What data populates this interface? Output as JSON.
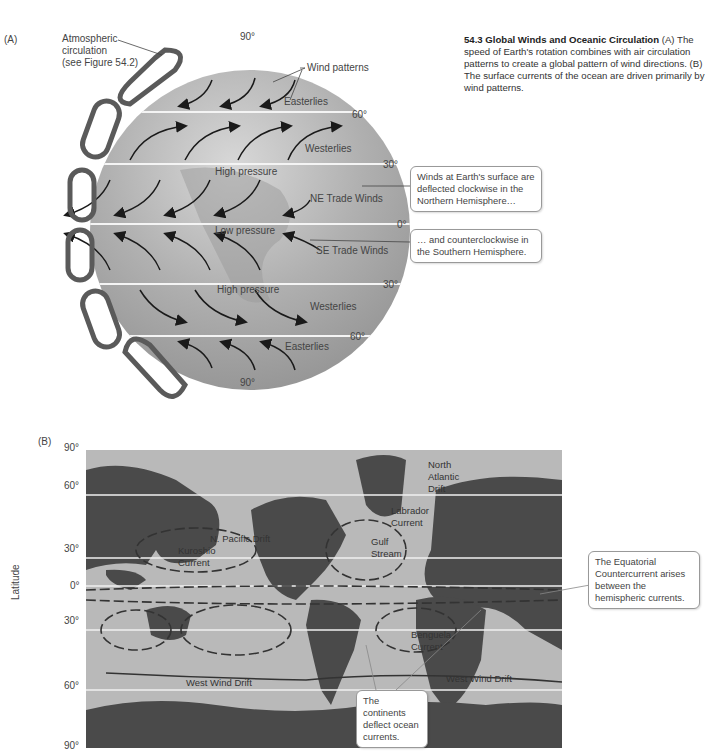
{
  "caption": {
    "number": "54.3",
    "title": "Global Winds and Oceanic Circulation",
    "text": "(A) The speed of Earth's rotation combines with air circulation patterns to create a global pattern of wind directions. (B) The surface currents of the ocean are driven primarily by wind patterns."
  },
  "panel_a": {
    "label": "(A)",
    "atmospheric_label_1": "Atmospheric",
    "atmospheric_label_2": "circulation",
    "atmospheric_label_3": "(see Figure 54.2)",
    "wind_patterns": "Wind patterns",
    "lat_90_top": "90°",
    "lat_60_n": "60°",
    "lat_30_n": "30°",
    "lat_0": "0°",
    "lat_30_s": "30°",
    "lat_60_s": "60°",
    "lat_90_bottom": "90°",
    "zones": {
      "easterlies_n": "Easterlies",
      "westerlies_n": "Westerlies",
      "high_pressure_n": "High pressure",
      "ne_trade": "NE Trade Winds",
      "low_pressure": "Low pressure",
      "se_trade": "SE Trade Winds",
      "high_pressure_s": "High pressure",
      "westerlies_s": "Westerlies",
      "easterlies_s": "Easterlies"
    },
    "callout_north": "Winds at Earth's surface are deflected clockwise in the Northern Hemisphere…",
    "callout_south": "… and counterclockwise in the Southern Hemisphere."
  },
  "panel_b": {
    "label": "(B)",
    "axis_label": "Latitude",
    "ticks": [
      "90°",
      "60°",
      "30°",
      "0°",
      "30°",
      "60°",
      "90°"
    ],
    "currents": {
      "north_atlantic_drift_1": "North",
      "north_atlantic_drift_2": "Atlantic",
      "north_atlantic_drift_3": "Drift",
      "labrador_1": "Labrador",
      "labrador_2": "Current",
      "gulf_1": "Gulf",
      "gulf_2": "Stream",
      "n_pacific": "N. Pacific Drift",
      "kuroshio_1": "Kuroshio",
      "kuroshio_2": "Current",
      "benguela_1": "Benguela",
      "benguela_2": "Current",
      "west_wind_drift_left": "West Wind Drift",
      "west_wind_drift_right": "West Wind Drift"
    },
    "callout_equatorial": "The Equatorial Countercurrent arises between the hemispheric currents.",
    "callout_continents": "The continents deflect ocean currents."
  },
  "colors": {
    "globe": "#a9a9a9",
    "ocean": "#b9b9b9",
    "land": "#4a4a4a",
    "cell_loop": "#5a5a5a",
    "arrow": "#1a1a1a"
  }
}
